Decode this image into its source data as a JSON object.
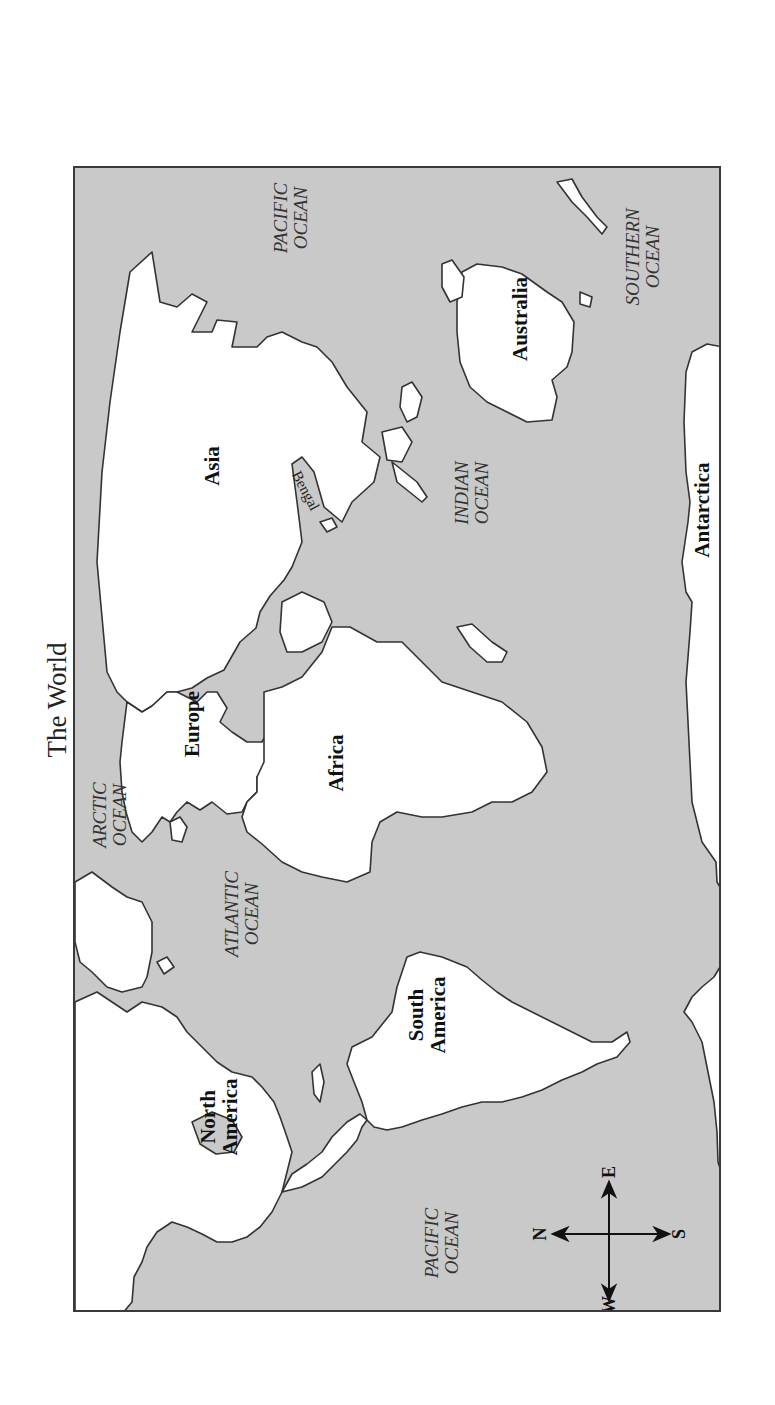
{
  "title": "The World",
  "map": {
    "orientation": "rotated 90deg clockwise (north points left)",
    "colors": {
      "ocean": "#c9c9c9",
      "land": "#ffffff",
      "outline": "#333333",
      "frame": "#3a3a3a"
    },
    "continents": [
      {
        "id": "north-america",
        "label_line1": "North",
        "label_line2": "America"
      },
      {
        "id": "south-america",
        "label_line1": "South",
        "label_line2": "America"
      },
      {
        "id": "europe",
        "label": "Europe"
      },
      {
        "id": "africa",
        "label": "Africa"
      },
      {
        "id": "asia",
        "label": "Asia"
      },
      {
        "id": "australia",
        "label": "Australia"
      },
      {
        "id": "antarctica",
        "label": "Antarctica"
      }
    ],
    "oceans": [
      {
        "id": "pacific-east",
        "line1": "PACIFIC",
        "line2": "OCEAN"
      },
      {
        "id": "arctic",
        "line1": "ARCTIC",
        "line2": "OCEAN"
      },
      {
        "id": "atlantic",
        "line1": "ATLANTIC",
        "line2": "OCEAN"
      },
      {
        "id": "indian",
        "line1": "INDIAN",
        "line2": "OCEAN"
      },
      {
        "id": "southern",
        "line1": "SOUTHERN",
        "line2": "OCEAN"
      },
      {
        "id": "pacific-west",
        "line1": "PACIFIC",
        "line2": "OCEAN"
      }
    ],
    "features": {
      "bengal": "Bengal"
    },
    "compass": {
      "north": "N",
      "south": "S",
      "east": "E",
      "west": "W"
    }
  }
}
